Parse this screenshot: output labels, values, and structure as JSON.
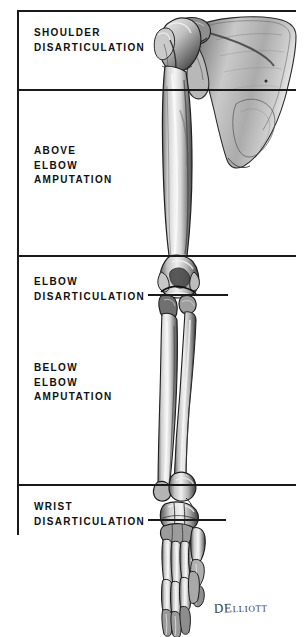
{
  "figure": {
    "background_color": "#ffffff",
    "line_color": "#1a1a1a",
    "artist_signature": "DElliott"
  },
  "levels": [
    {
      "id": "shoulder-disarticulation",
      "line1": "SHOULDER",
      "line2": "DISARTICULATION",
      "line3": "",
      "has_leader": false
    },
    {
      "id": "above-elbow-amputation",
      "line1": "ABOVE",
      "line2": "ELBOW",
      "line3": "AMPUTATION",
      "has_leader": false
    },
    {
      "id": "elbow-disarticulation",
      "line1": "ELBOW",
      "line2": "DISARTICULATION",
      "line3": "",
      "has_leader": true
    },
    {
      "id": "below-elbow-amputation",
      "line1": "BELOW",
      "line2": "ELBOW",
      "line3": "AMPUTATION",
      "has_leader": false
    },
    {
      "id": "wrist-disarticulation",
      "line1": "WRIST",
      "line2": "DISARTICULATION",
      "line3": "",
      "has_leader": true
    }
  ],
  "anatomy": {
    "parts": [
      "scapula",
      "humerus-head",
      "humerus-shaft",
      "elbow-joint",
      "radius",
      "ulna",
      "carpals",
      "metacarpals",
      "phalanges",
      "thumb"
    ]
  }
}
